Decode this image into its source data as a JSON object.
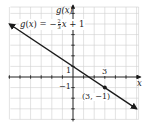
{
  "chart_data": {
    "type": "line",
    "title": "",
    "function_label": {
      "lhs": "g(x) = −",
      "frac_num": "2",
      "frac_den": "3",
      "rhs": "x + 1"
    },
    "xlabel": "x",
    "ylabel": "g(x)",
    "xlim": [
      -6,
      6
    ],
    "ylim": [
      -4,
      6
    ],
    "grid": true,
    "tick_labels": {
      "x": [
        {
          "value": 3,
          "label": "3"
        }
      ],
      "y": [
        {
          "value": 1,
          "label": "1"
        },
        {
          "value": -1,
          "label": "−1"
        }
      ]
    },
    "series": [
      {
        "name": "g(x) = -2/3 x + 1",
        "equation": "-2/3*x + 1",
        "slope": -0.6667,
        "intercept": 1,
        "x": [
          -6,
          6
        ],
        "y": [
          5,
          -3
        ],
        "arrows": "both",
        "color": "#1a1a1a"
      }
    ],
    "points": [
      {
        "x": 3,
        "y": -1,
        "label": "(3, −1)"
      }
    ],
    "annotations": [
      "(3, −1)"
    ]
  },
  "colors": {
    "grid": "#cfcfcf",
    "axis": "#1a1a1a",
    "line": "#1a1a1a",
    "background": "#ffffff"
  }
}
